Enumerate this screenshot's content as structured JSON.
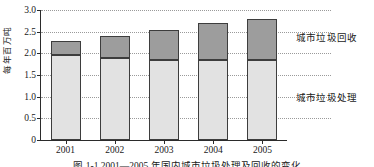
{
  "chart_data": {
    "type": "bar",
    "stacked": true,
    "title": "",
    "xlabel": "",
    "ylabel": "每年百万吨",
    "categories": [
      "2001",
      "2002",
      "2003",
      "2004",
      "2005"
    ],
    "series": [
      {
        "name": "城市垃圾处理",
        "color": "#e2e2e2",
        "values": [
          1.97,
          1.89,
          1.84,
          1.84,
          1.84
        ]
      },
      {
        "name": "城市垃圾回收",
        "color": "#9d9d9d",
        "values": [
          0.31,
          0.51,
          0.71,
          0.86,
          0.96
        ]
      }
    ],
    "totals": [
      2.28,
      2.4,
      2.55,
      2.7,
      2.8
    ],
    "ylim": [
      0,
      3.0
    ],
    "yticks": [
      0,
      0.5,
      1.0,
      1.5,
      2.0,
      2.5,
      3.0
    ],
    "ytick_labels": [
      "0",
      "0.5",
      "1.0",
      "1.5",
      "2.0",
      "2.5",
      "3.0"
    ],
    "grid": true,
    "grid_style": "dotted",
    "legend_position": "right"
  },
  "legend": {
    "recycle_label": "城市垃圾回收",
    "treat_label": "城市垃圾处理"
  },
  "caption": "图 1-1  2001—2005 年国内城市垃圾处理及回收的变化"
}
